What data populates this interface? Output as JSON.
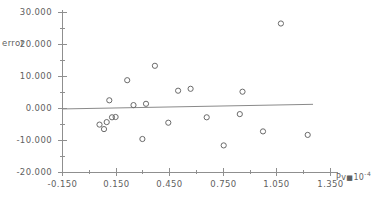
{
  "chart_data": {
    "type": "scatter",
    "title": "",
    "xlabel": "Pv*10-4",
    "ylabel": "error",
    "xlim": [
      -0.15,
      1.35
    ],
    "ylim": [
      -20.0,
      30.0
    ],
    "grid": false,
    "legend": null,
    "xticks": [
      "-0.150",
      "0.150",
      "0.450",
      "0.750",
      "1.050",
      "1.350"
    ],
    "xtick_values": [
      -0.15,
      0.15,
      0.45,
      0.75,
      1.05,
      1.35
    ],
    "yticks": [
      "30.000",
      "20.000",
      "10.000",
      "0.000",
      "-10.000",
      "-20.000"
    ],
    "ytick_values": [
      30.0,
      20.0,
      10.0,
      0.0,
      -10.0,
      -20.0
    ],
    "minor_ticks": true,
    "marker": "open-circle",
    "series": [
      {
        "name": "error",
        "points": [
          {
            "x": 0.06,
            "y": -5.2
          },
          {
            "x": 0.085,
            "y": -6.6
          },
          {
            "x": 0.1,
            "y": -4.4
          },
          {
            "x": 0.13,
            "y": -2.9
          },
          {
            "x": 0.15,
            "y": -2.8
          },
          {
            "x": 0.115,
            "y": 2.4
          },
          {
            "x": 0.215,
            "y": 8.7
          },
          {
            "x": 0.25,
            "y": 0.9
          },
          {
            "x": 0.32,
            "y": 1.3
          },
          {
            "x": 0.37,
            "y": 13.2
          },
          {
            "x": 0.3,
            "y": -9.7
          },
          {
            "x": 0.445,
            "y": -4.6
          },
          {
            "x": 0.5,
            "y": 5.4
          },
          {
            "x": 0.57,
            "y": 6.0
          },
          {
            "x": 0.66,
            "y": -2.9
          },
          {
            "x": 0.755,
            "y": -11.7
          },
          {
            "x": 0.845,
            "y": -1.9
          },
          {
            "x": 0.86,
            "y": 5.1
          },
          {
            "x": 0.975,
            "y": -7.3
          },
          {
            "x": 1.075,
            "y": 26.4
          },
          {
            "x": 1.225,
            "y": -8.4
          }
        ]
      }
    ],
    "trendline": {
      "x_start": -0.15,
      "y_start": -0.3,
      "x_end": 1.255,
      "y_end": 1.15
    },
    "line_color": "#8a8a8a",
    "marker_color": "#6a6a6a",
    "axis_color": "#8f8f8f"
  }
}
